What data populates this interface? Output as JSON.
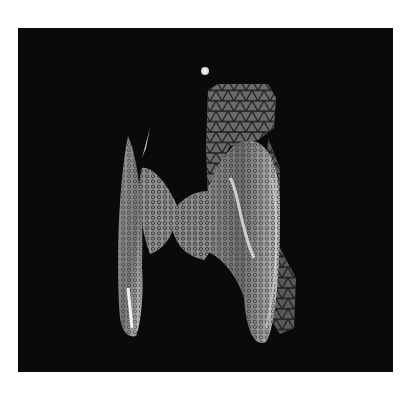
{
  "image": {
    "description": "Grayscale 3D fluorescence-style render of a translucent honeycomb/mesh textured structure on a black background",
    "background_color": "#0a0a0a",
    "page_color": "#ffffff",
    "features": [
      {
        "name": "bright-dot",
        "shape": "circle"
      },
      {
        "name": "triangle-mesh-patch",
        "shape": "mesh"
      },
      {
        "name": "left-blade",
        "shape": "elongated-lobe"
      },
      {
        "name": "left-inner-lobe",
        "shape": "lobe"
      },
      {
        "name": "center-lobe",
        "shape": "lobe"
      },
      {
        "name": "right-large-lobe",
        "shape": "oval-lobe"
      },
      {
        "name": "right-mesh-tail",
        "shape": "mesh"
      }
    ]
  }
}
